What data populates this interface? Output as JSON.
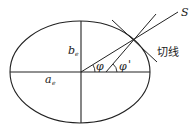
{
  "diagram": {
    "title": "",
    "labels": {
      "semi_minor_axis": "b",
      "semi_minor_axis_sub": "e",
      "semi_major_axis": "a",
      "semi_major_axis_sub": "e",
      "geocentric_angle": "φ",
      "geodetic_angle": "φ",
      "geodetic_prime": "'",
      "direction": "S",
      "tangent": "切线"
    },
    "colors": {
      "stroke": "#222222",
      "background": "#ffffff"
    }
  }
}
